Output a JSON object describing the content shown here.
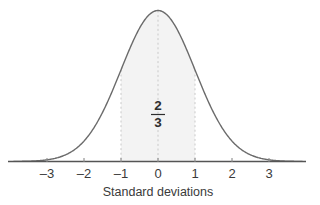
{
  "chart_data": {
    "type": "area",
    "title": "",
    "subtitle": "",
    "xlabel": "Standard deviations",
    "ylabel": "",
    "x_ticks": [
      -3,
      -2,
      -1,
      0,
      1,
      2,
      3
    ],
    "x_tick_labels": [
      "–3",
      "–2",
      "–1",
      "0",
      "1",
      "2",
      "3"
    ],
    "xlim": [
      -3.9,
      3.9
    ],
    "ylim": [
      0,
      1.08
    ],
    "grid": false,
    "legend": "none",
    "curve": {
      "name": "standard normal density",
      "distribution": "normal",
      "mean": 0,
      "sd": 1,
      "stroke_color": "#6b6b6b",
      "stroke_width": 1.4
    },
    "shaded_region": {
      "from": -1,
      "to": 1,
      "fill_color": "#f3f3f3",
      "area_label": "2/3",
      "area_numerator": "2",
      "area_denominator": "3"
    },
    "reference_lines": [
      {
        "x": -1,
        "style": "dashed",
        "color": "#c9c9c9"
      },
      {
        "x": 0,
        "style": "dashed",
        "color": "#c9c9c9"
      },
      {
        "x": 1,
        "style": "dashed",
        "color": "#c9c9c9"
      }
    ],
    "annotations": [
      {
        "text": "2/3",
        "x": 0,
        "y": 0.42,
        "kind": "fraction"
      }
    ],
    "axis_color": "#555555",
    "sampled_curve": {
      "x": [
        -3.9,
        -3.6,
        -3.3,
        -3.0,
        -2.7,
        -2.4,
        -2.1,
        -1.8,
        -1.5,
        -1.2,
        -0.9,
        -0.6,
        -0.3,
        0.0,
        0.3,
        0.6,
        0.9,
        1.2,
        1.5,
        1.8,
        2.1,
        2.4,
        2.7,
        3.0,
        3.3,
        3.6,
        3.9
      ],
      "y": [
        0.0005,
        0.0015,
        0.0042,
        0.0111,
        0.0266,
        0.0561,
        0.1041,
        0.1979,
        0.3247,
        0.4868,
        0.667,
        0.8353,
        0.956,
        1.0,
        0.956,
        0.8353,
        0.667,
        0.4868,
        0.3247,
        0.1979,
        0.1041,
        0.0561,
        0.0266,
        0.0111,
        0.0042,
        0.0015,
        0.0005
      ]
    }
  },
  "figure": {
    "caption": "",
    "axis_title": "Standard deviations",
    "fraction_numerator": "2",
    "fraction_denominator": "3"
  }
}
